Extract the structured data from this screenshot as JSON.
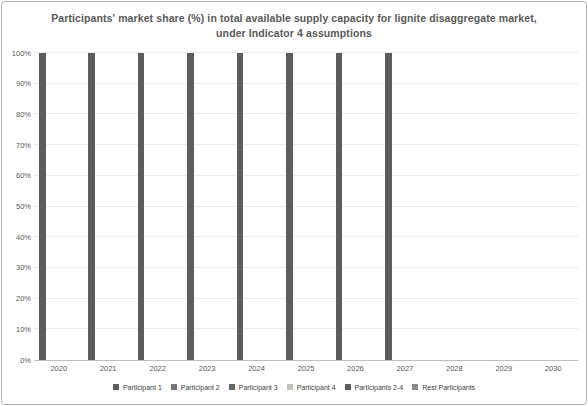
{
  "title": {
    "line1": "Participants' market share (%) in total available supply capacity for lignite disaggregate market,",
    "line2": "under Indicator 4 assumptions"
  },
  "chart_data": {
    "type": "bar",
    "title": "Participants' market share (%) in total available supply capacity for lignite disaggregate market, under Indicator 4 assumptions",
    "categories": [
      "2020",
      "2021",
      "2022",
      "2023",
      "2024",
      "2025",
      "2026",
      "2027",
      "2028",
      "2029",
      "2030"
    ],
    "series": [
      {
        "name": "Participant 1",
        "color": "#5d5d5d",
        "values": [
          100,
          100,
          100,
          100,
          100,
          100,
          100,
          100,
          null,
          null,
          null
        ]
      },
      {
        "name": "Participant 2",
        "color": "#767676",
        "values": [
          0,
          0,
          0,
          0,
          0,
          0,
          0,
          0,
          null,
          null,
          null
        ]
      },
      {
        "name": "Participant 3",
        "color": "#676767",
        "values": [
          0,
          0,
          0,
          0,
          0,
          0,
          0,
          0,
          null,
          null,
          null
        ]
      },
      {
        "name": "Participant 4",
        "color": "#c2c2c2",
        "values": [
          0,
          0,
          0,
          0,
          0,
          0,
          0,
          0,
          null,
          null,
          null
        ]
      },
      {
        "name": "Participants 2-4",
        "color": "#5e5e5e",
        "values": [
          0,
          0,
          0,
          0,
          0,
          0,
          0,
          0,
          null,
          null,
          null
        ]
      },
      {
        "name": "Rest Participants",
        "color": "#8a8a8a",
        "values": [
          0,
          0,
          0,
          0,
          0,
          0,
          0,
          0,
          null,
          null,
          null
        ]
      }
    ],
    "xlabel": "",
    "ylabel": "",
    "ylim": [
      0,
      100
    ],
    "yticks": [
      "0%",
      "10%",
      "20%",
      "30%",
      "40%",
      "50%",
      "60%",
      "70%",
      "80%",
      "90%",
      "100%"
    ],
    "grid": true,
    "legend_position": "bottom"
  },
  "colors": {
    "title_text": "#595959",
    "axis_text": "#595959",
    "gridline": "#efedeb",
    "axis_line": "#bfbfbf",
    "frame_border": "#b5b2ae",
    "background": "#ffffff"
  }
}
